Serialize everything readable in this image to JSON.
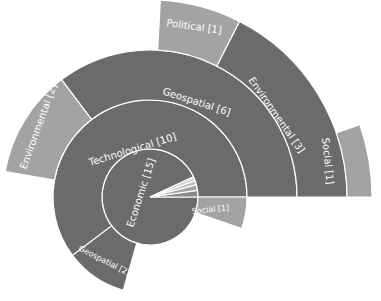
{
  "chart_data": {
    "type": "sunburst",
    "title": "",
    "center": [
      150,
      197
    ],
    "colors": {
      "dark": "#6b6b6b",
      "light": "#a3a3a3",
      "lighter": "#c4c4c4",
      "background": "#ffffff"
    },
    "rings": [
      {
        "level": 1,
        "inner_radius": 0,
        "outer_radius": 48,
        "segments": [
          {
            "name": "Economic",
            "value": 15,
            "label": "Economic [15]",
            "start_deg": 25,
            "end_deg": 360,
            "color": "#6b6b6b"
          },
          {
            "name": "small-slice-1",
            "value": null,
            "label": "",
            "start_deg": 0,
            "end_deg": 8,
            "color": "#8a8a8a"
          },
          {
            "name": "small-slice-2",
            "value": null,
            "label": "",
            "start_deg": 8,
            "end_deg": 15,
            "color": "#a5a5a5"
          },
          {
            "name": "small-slice-3",
            "value": null,
            "label": "",
            "start_deg": 15,
            "end_deg": 20,
            "color": "#bdbdbd"
          },
          {
            "name": "small-slice-4",
            "value": null,
            "label": "",
            "start_deg": 20,
            "end_deg": 25,
            "color": "#d6d6d6"
          }
        ]
      },
      {
        "level": 2,
        "inner_radius": 48,
        "outer_radius": 97,
        "segments": [
          {
            "name": "Technological",
            "value": 10,
            "label": "Technological [10]",
            "start_deg": 0,
            "end_deg": 217,
            "color": "#6b6b6b"
          },
          {
            "name": "Geospatial",
            "value": 2,
            "label": "Geospatial [2]",
            "start_deg": 217,
            "end_deg": 254,
            "color": "#6b6b6b"
          },
          {
            "name": "Social",
            "value": 1,
            "label": "Social [1]",
            "start_deg": -19,
            "end_deg": 0,
            "color": "#a3a3a3"
          }
        ]
      },
      {
        "level": 3,
        "inner_radius": 97,
        "outer_radius": 147,
        "segments": [
          {
            "name": "Geospatial",
            "value": 6,
            "label": "Geospatial [6]",
            "start_deg": 0,
            "end_deg": 127,
            "color": "#6b6b6b"
          },
          {
            "name": "Environmental",
            "value": 2,
            "label": "Environmental [2]",
            "start_deg": 127,
            "end_deg": 170,
            "color": "#a3a3a3"
          }
        ]
      },
      {
        "level": 4,
        "inner_radius": 147,
        "outer_radius": 197,
        "segments": [
          {
            "name": "Environmental",
            "value": 3,
            "label": "Environmental [3]",
            "start_deg": 0,
            "end_deg": 63,
            "color": "#6b6b6b"
          },
          {
            "name": "Political",
            "value": 1,
            "label": "Political [1]",
            "start_deg": 63,
            "end_deg": 87,
            "color": "#a3a3a3"
          }
        ]
      },
      {
        "level": 5,
        "inner_radius": 197,
        "outer_radius": 222,
        "segments": [
          {
            "name": "Social",
            "value": 1,
            "label": "Social [1]",
            "start_deg": 0,
            "end_deg": 19,
            "color": "#a3a3a3"
          }
        ]
      }
    ],
    "labels": {
      "economic": "Economic [15]",
      "technological": "Technological [10]",
      "geospatial_2": "Geospatial [2]",
      "social_inner": "Social [1]",
      "geospatial_6": "Geospatial [6]",
      "environmental_2": "Environmental [2]",
      "environmental_3": "Environmental [3]",
      "political_1": "Political [1]",
      "social_outer": "Social [1]"
    },
    "legend": null,
    "grid": false
  }
}
